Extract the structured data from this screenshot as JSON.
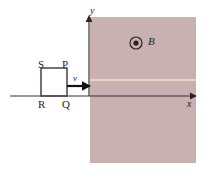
{
  "figure": {
    "background_color": "#ffffff",
    "width": 206,
    "height": 174
  },
  "field_region": {
    "name": "magnetic-field-region",
    "fill_color": "#cbb3b3",
    "x": 90,
    "y": 17,
    "width": 106,
    "height": 146,
    "boundary_line_color": "#ece0c8",
    "boundary_line_y": 80
  },
  "axes": {
    "x_label": "x",
    "y_label": "y",
    "axis_color": "#3a3238",
    "origin_x": 89,
    "origin_y": 96,
    "x_start": 10,
    "x_end": 196,
    "y_top": 18,
    "y_bottom": 96
  },
  "loop": {
    "name": "square-loop",
    "outline_color": "#4a4046",
    "x": 41,
    "y": 68,
    "width": 26,
    "height": 28,
    "vertices": [
      {
        "id": "S",
        "label": "S",
        "position": "top-left"
      },
      {
        "id": "P",
        "label": "P",
        "position": "top-right"
      },
      {
        "id": "Q",
        "label": "Q",
        "position": "bottom-right"
      },
      {
        "id": "R",
        "label": "R",
        "position": "bottom-left"
      }
    ]
  },
  "velocity": {
    "label": "v",
    "direction": "right",
    "arrow_color": "#14100f",
    "arrow_start_x": 67,
    "arrow_end_x": 90,
    "arrow_y": 86
  },
  "magnetic_field": {
    "label": "B",
    "symbol": "dot-in-circle",
    "meaning": "out-of-page",
    "circle_center_x": 136,
    "circle_center_y": 43,
    "circle_radius": 6,
    "dot_radius": 2.6,
    "color": "#2a2226"
  }
}
